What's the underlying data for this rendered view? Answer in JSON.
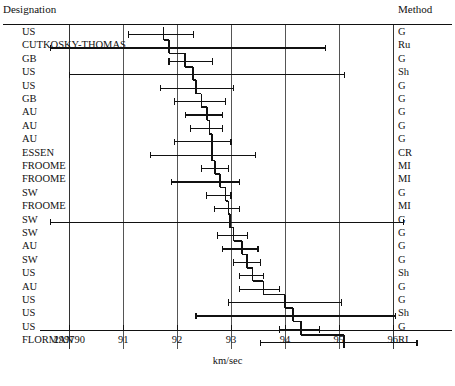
{
  "header": {
    "left_title": "Designation",
    "right_title": "Method"
  },
  "axis": {
    "title": "km/sec",
    "tick_labels": [
      "299790",
      "91",
      "92",
      "93",
      "94",
      "95",
      "96"
    ],
    "tick_values": [
      90,
      91,
      92,
      93,
      94,
      95,
      96
    ]
  },
  "chart_data": {
    "type": "forest",
    "title": "",
    "xlabel": "km/sec",
    "ylabel": "",
    "xlim": [
      89.65,
      96.65
    ],
    "grid": true,
    "legend": "none",
    "x_tick_labels": [
      "299790",
      "91",
      "92",
      "93",
      "94",
      "95",
      "96"
    ],
    "x_ticks": [
      90,
      91,
      92,
      93,
      94,
      95,
      96
    ],
    "note": "x axis values are offsets in km/sec added to 299790; tick labeled 299790 is value 90",
    "categories": [
      "Designation",
      "Method",
      "Estimate",
      "Lower",
      "Upper"
    ],
    "rows": [
      {
        "designation": "US",
        "method": "G",
        "estimate": 91.75,
        "lower": 91.1,
        "upper": 92.3
      },
      {
        "designation": "CUTKOSKY-THOMAS",
        "method": "Ru",
        "estimate": 91.85,
        "lower": 69.0,
        "upper": 94.75
      },
      {
        "designation": "GB",
        "method": "G",
        "estimate": 92.15,
        "lower": 91.85,
        "upper": 92.65
      },
      {
        "designation": "US",
        "method": "Sh",
        "estimate": 92.3,
        "lower": 90.0,
        "upper": 95.1
      },
      {
        "designation": "US",
        "method": "G",
        "estimate": 92.35,
        "lower": 91.7,
        "upper": 93.05
      },
      {
        "designation": "GB",
        "method": "G",
        "estimate": 92.45,
        "lower": 91.95,
        "upper": 92.9
      },
      {
        "designation": "AU",
        "method": "G",
        "estimate": 92.55,
        "lower": 92.15,
        "upper": 92.85
      },
      {
        "designation": "AU",
        "method": "G",
        "estimate": 92.6,
        "lower": 92.25,
        "upper": 92.85
      },
      {
        "designation": "AU",
        "method": "G",
        "estimate": 92.65,
        "lower": 91.95,
        "upper": 93.0
      },
      {
        "designation": "ESSEN",
        "method": "CR",
        "estimate": 92.65,
        "lower": 91.5,
        "upper": 93.45
      },
      {
        "designation": "FROOME",
        "method": "MI",
        "estimate": 92.7,
        "lower": 92.45,
        "upper": 92.95
      },
      {
        "designation": "FROOME",
        "method": "MI",
        "estimate": 92.8,
        "lower": 91.9,
        "upper": 93.15
      },
      {
        "designation": "SW",
        "method": "G",
        "estimate": 92.9,
        "lower": 92.55,
        "upper": 93.0
      },
      {
        "designation": "FROOME",
        "method": "MI",
        "estimate": 92.95,
        "lower": 92.7,
        "upper": 93.15
      },
      {
        "designation": "SW",
        "method": "G",
        "estimate": 92.98,
        "lower": 89.65,
        "upper": 96.2
      },
      {
        "designation": "SW",
        "method": "G",
        "estimate": 93.05,
        "lower": 92.75,
        "upper": 93.3
      },
      {
        "designation": "AU",
        "method": "G",
        "estimate": 93.2,
        "lower": 92.85,
        "upper": 93.5
      },
      {
        "designation": "SW",
        "method": "G",
        "estimate": 93.3,
        "lower": 93.05,
        "upper": 93.55
      },
      {
        "designation": "US",
        "method": "Sh",
        "estimate": 93.4,
        "lower": 93.15,
        "upper": 93.6
      },
      {
        "designation": "AU",
        "method": "G",
        "estimate": 93.6,
        "lower": 93.15,
        "upper": 93.9
      },
      {
        "designation": "US",
        "method": "G",
        "estimate": 94.0,
        "lower": 92.95,
        "upper": 95.05
      },
      {
        "designation": "US",
        "method": "Sh",
        "estimate": 94.15,
        "lower": 92.35,
        "upper": 96.05
      },
      {
        "designation": "US",
        "method": "G",
        "estimate": 94.3,
        "lower": 93.9,
        "upper": 94.65
      },
      {
        "designation": "FLORMAN",
        "method": "RI",
        "estimate": 95.1,
        "lower": 93.55,
        "upper": 96.45
      }
    ]
  },
  "colors": {
    "ink": "#111111",
    "grid": "#555555",
    "background": "#ffffff"
  }
}
